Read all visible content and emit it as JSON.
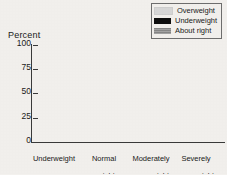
{
  "chart_data": {
    "type": "bar",
    "subtype": "stacked-bar-100",
    "title": "",
    "xlabel": "",
    "ylabel": "Percent",
    "ylim": [
      0,
      100
    ],
    "yticks": [
      0,
      25,
      50,
      75,
      100
    ],
    "ytick_labels": [
      "0",
      "25",
      "50",
      "75",
      "100"
    ],
    "grid": false,
    "legend_position": "top-right",
    "categories": [
      "Underweight",
      "Normal weight",
      "Moderately overweight",
      "Severely overweight"
    ],
    "category_lines": [
      [
        "Underweight"
      ],
      [
        "Normal",
        "weight"
      ],
      [
        "Moderately",
        "overweight"
      ],
      [
        "Severely",
        "overweight"
      ]
    ],
    "series": [
      {
        "name": "About right",
        "color": "#8d8d8d",
        "values": [
          72,
          60,
          13,
          6
        ]
      },
      {
        "name": "Underweight",
        "color": "#0d0d0d",
        "values": [
          23,
          3,
          2,
          0
        ]
      },
      {
        "name": "Overweight",
        "color": "#c9c9c9",
        "values": [
          5,
          37,
          85,
          94
        ]
      }
    ],
    "legend_order": [
      "Overweight",
      "Underweight",
      "About right"
    ]
  },
  "legend": {
    "items": [
      {
        "label": "Overweight",
        "swatch": "overweight-swatch"
      },
      {
        "label": "Underweight",
        "swatch": "underweight-swatch"
      },
      {
        "label": "About right",
        "swatch": "about-right-swatch"
      }
    ]
  },
  "axes": {
    "y_title": "Percent",
    "y_ticks": [
      "100",
      "75",
      "50",
      "25",
      "0"
    ]
  },
  "categories": {
    "c0_l0": "Underweight",
    "c1_l0": "Normal",
    "c1_l1": "weight",
    "c2_l0": "Moderately",
    "c2_l1": "overweight",
    "c3_l0": "Severely",
    "c3_l1": "overweight"
  }
}
